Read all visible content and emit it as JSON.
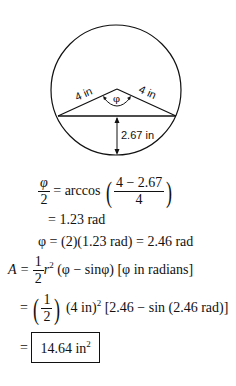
{
  "diagram": {
    "type": "circular-segment",
    "radius_label": "4 in",
    "radius_label_right": "4 in",
    "angle_label": "φ",
    "height_label": "2.67 in",
    "circle": {
      "cx": 116,
      "cy": 90,
      "r": 65
    },
    "apex": {
      "x": 117,
      "y": 89
    },
    "chord": {
      "x1": 58,
      "y1": 116,
      "x2": 176,
      "y2": 116
    }
  },
  "equations": {
    "line1": {
      "lhs_num": "φ",
      "lhs_den": "2",
      "op": "= arccos",
      "rhs_num": "4 − 2.67",
      "rhs_den": "4"
    },
    "line2": "= 1.23 rad",
    "line3": "φ = (2)(1.23 rad) = 2.46 rad",
    "line4": {
      "lhs": "A =",
      "num": "1",
      "den": "2",
      "rest_r": "r",
      "rest_exp": "2",
      "rest": " (φ − sinφ)  [φ in radians]"
    },
    "line5": {
      "eq": "=",
      "num": "1",
      "den": "2",
      "base": " (4 in)",
      "exp": "2",
      "rest": " [2.46 − sin (2.46 rad)]"
    },
    "line6": {
      "eq": "=",
      "result": "14.64 in",
      "result_exp": "2"
    }
  }
}
